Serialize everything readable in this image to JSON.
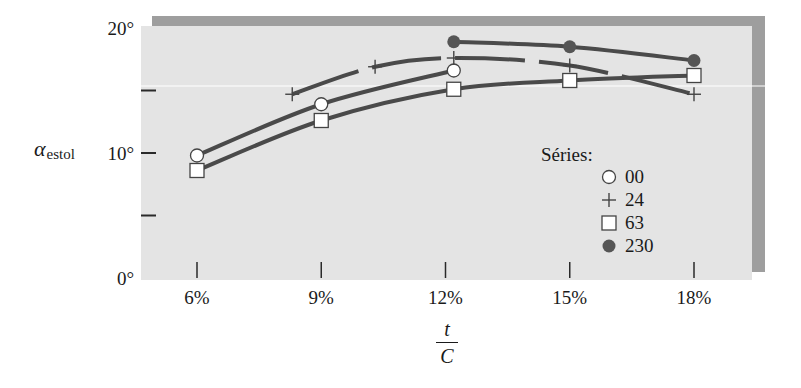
{
  "chart_data": {
    "type": "line",
    "title": "",
    "xlabel": "t/C",
    "xlabel_num": "t",
    "xlabel_den": "C",
    "ylabel": "α",
    "ylabel_sub": "estol",
    "xlim": [
      4.7,
      19.3
    ],
    "ylim": [
      0,
      20
    ],
    "x_ticks": [
      6,
      9,
      12,
      15,
      18
    ],
    "x_tick_labels": [
      "6%",
      "9%",
      "12%",
      "15%",
      "18%"
    ],
    "y_ticks": [
      0,
      5,
      10,
      15,
      20
    ],
    "y_tick_labels": [
      "0°",
      "",
      "10°",
      "",
      "20°"
    ],
    "grid": false,
    "legend_title": "Séries:",
    "legend_position": "right-inside",
    "series": [
      {
        "name": "00",
        "marker": "open-circle",
        "x": [
          6,
          9,
          12.2
        ],
        "y": [
          9.8,
          13.9,
          16.6
        ]
      },
      {
        "name": "24",
        "marker": "plus",
        "x": [
          8.3,
          10.3,
          12.2,
          15,
          18
        ],
        "y": [
          14.7,
          16.9,
          17.6,
          17.0,
          14.7
        ]
      },
      {
        "name": "63",
        "marker": "open-square",
        "x": [
          6,
          9,
          12.2,
          15,
          18
        ],
        "y": [
          8.6,
          12.6,
          15.1,
          15.8,
          16.2
        ]
      },
      {
        "name": "230",
        "marker": "filled-circle",
        "x": [
          12.2,
          15,
          18
        ],
        "y": [
          18.9,
          18.5,
          17.4
        ]
      }
    ]
  },
  "colors": {
    "plot_bg": "#e4e4e4",
    "shadow": "#9e9e9e",
    "line": "#4a4a4a",
    "marker_fill_open": "#ffffff",
    "marker_fill_solid": "#555555"
  }
}
